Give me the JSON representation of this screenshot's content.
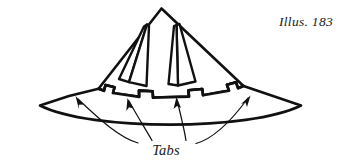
{
  "figure": {
    "caption": "Illus. 183",
    "callout_label": "Tabs",
    "line_color": "#111111",
    "fill_color": "#ffffff",
    "background_color": "#ffffff",
    "stroke_width_outline": 2.6,
    "stroke_width_leader": 1.1,
    "arrow_count": 4,
    "tab_count": 4,
    "dart_count": 2
  }
}
